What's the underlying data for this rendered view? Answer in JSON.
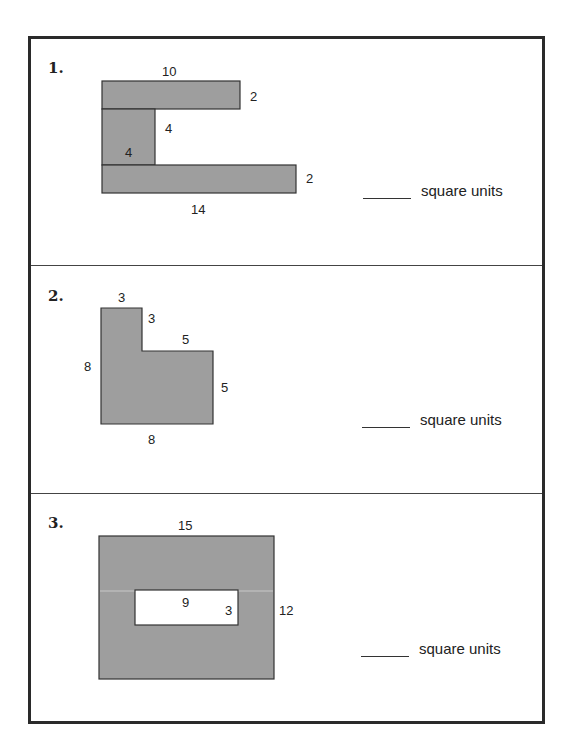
{
  "worksheet": {
    "answer_units": "square units",
    "fill_color": "#9e9e9e",
    "problems": [
      {
        "number": "1.",
        "shape": "C-shaped composite figure (three rectangles)",
        "labels": {
          "top": "10",
          "top_right": "2",
          "inner_vertical": "4",
          "inner_width": "4",
          "bottom_right": "2",
          "bottom": "14"
        },
        "answer_value": ""
      },
      {
        "number": "2.",
        "shape": "L-shaped composite figure",
        "labels": {
          "top": "3",
          "notch_height": "3",
          "step_width": "5",
          "left": "8",
          "right": "5",
          "bottom": "8"
        },
        "answer_value": ""
      },
      {
        "number": "3.",
        "shape": "Rectangle with rectangular hole",
        "labels": {
          "top": "15",
          "hole_width": "9",
          "hole_height": "3",
          "right": "12"
        },
        "answer_value": ""
      }
    ]
  }
}
